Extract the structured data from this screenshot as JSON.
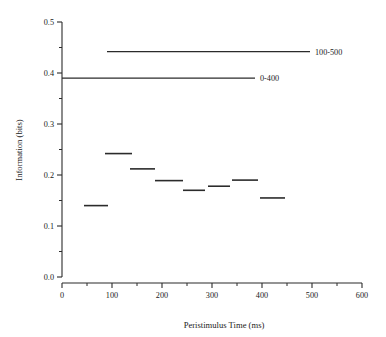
{
  "chart_data": {
    "type": "line",
    "title": "",
    "xlabel": "Peristimulus Time (ms)",
    "ylabel": "Information (bits)",
    "xlim": [
      0,
      600
    ],
    "ylim": [
      0.0,
      0.5
    ],
    "grid": false,
    "legend_position": "inline-right",
    "xticks": [
      0,
      100,
      200,
      300,
      400,
      500,
      600
    ],
    "xtick_labels": [
      "0",
      "100",
      "200",
      "300",
      "400",
      "500",
      "600"
    ],
    "xminor_ticks": [
      50,
      150,
      250,
      350,
      450,
      550
    ],
    "yticks": [
      0.0,
      0.1,
      0.2,
      0.3,
      0.4,
      0.5
    ],
    "ytick_labels": [
      "0.0",
      "0.1",
      "0.2",
      "0.3",
      "0.4",
      "0.5"
    ],
    "yminor_ticks": [
      0.05,
      0.15,
      0.25,
      0.35,
      0.45
    ],
    "series": [
      {
        "name": "binned-information",
        "style": "step-segments",
        "segments": [
          {
            "x_start": 44,
            "x_end": 92,
            "value": 0.14
          },
          {
            "x_start": 86,
            "x_end": 140,
            "value": 0.242
          },
          {
            "x_start": 136,
            "x_end": 186,
            "value": 0.212
          },
          {
            "x_start": 186,
            "x_end": 242,
            "value": 0.189
          },
          {
            "x_start": 242,
            "x_end": 286,
            "value": 0.17
          },
          {
            "x_start": 292,
            "x_end": 336,
            "value": 0.178
          },
          {
            "x_start": 340,
            "x_end": 392,
            "value": 0.19
          },
          {
            "x_start": 396,
            "x_end": 446,
            "value": 0.155
          }
        ]
      }
    ],
    "reference_lines": [
      {
        "label": "100-500",
        "value": 0.442,
        "x_start": 90,
        "x_end": 496,
        "label_x": 506
      },
      {
        "label": "0-400",
        "value": 0.39,
        "x_start": 0,
        "x_end": 386,
        "label_x": 396
      }
    ]
  }
}
